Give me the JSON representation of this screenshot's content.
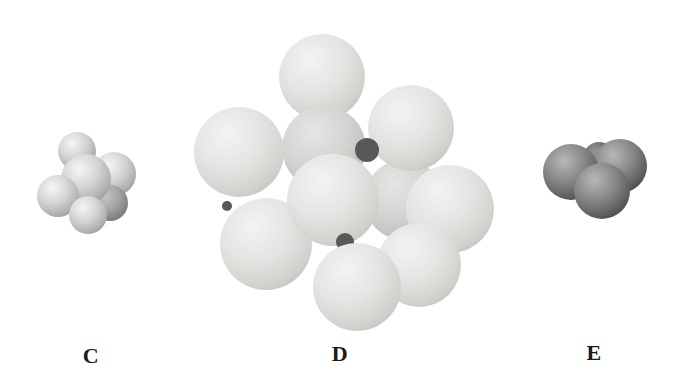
{
  "figure": {
    "type": "molecular-model-illustration",
    "background": "#ffffff",
    "width": 679,
    "height": 371,
    "label_color": "#1a1a1a",
    "clusters": [
      {
        "label": "C",
        "name": "small-light-gray-sphere-cluster",
        "label_x": 91,
        "label_y": 356,
        "palette": {
          "gradients": {
            "main": {
              "highlight": "#f6f6f6",
              "mid": "#d3d3d3",
              "low": "#aeaeae",
              "edge": "#898989"
            },
            "shaded": {
              "highlight": "#c6c6c6",
              "mid": "#a4a4a4",
              "low": "#828282",
              "edge": "#686868"
            }
          },
          "gap": "#6e6e6e"
        },
        "spheres": [
          {
            "name": "top",
            "cx": 77,
            "cy": 151,
            "r": 19
          },
          {
            "name": "right",
            "cx": 114,
            "cy": 174,
            "r": 22
          },
          {
            "name": "back-lower-right",
            "cx": 110,
            "cy": 203,
            "r": 18,
            "variant": "shaded"
          },
          {
            "name": "center",
            "cx": 86,
            "cy": 179,
            "r": 25
          },
          {
            "name": "left",
            "cx": 58,
            "cy": 196,
            "r": 21
          },
          {
            "name": "front-bottom",
            "cx": 88,
            "cy": 215,
            "r": 19
          }
        ]
      },
      {
        "label": "D",
        "name": "large-pale-sphere-cluster",
        "label_x": 340,
        "label_y": 354,
        "palette": {
          "gradients": {
            "main": {
              "highlight": "#f4f3f1",
              "mid": "#e5e4e2",
              "low": "#d2d1ce",
              "edge": "#b9b8b5"
            },
            "shaded": {
              "highlight": "#e6e5e3",
              "mid": "#d6d5d3",
              "low": "#c3c2bf",
              "edge": "#adacaa"
            }
          },
          "gap": "#585858"
        },
        "spheres": [
          {
            "name": "top",
            "cx": 322,
            "cy": 77,
            "r": 43
          },
          {
            "name": "upper-middle-back",
            "cx": 324,
            "cy": 148,
            "r": 42,
            "variant": "shaded"
          },
          {
            "name": "middle-right-back",
            "cx": 404,
            "cy": 200,
            "r": 40,
            "variant": "shaded"
          },
          {
            "name": "upper-right",
            "cx": 411,
            "cy": 128,
            "r": 43
          },
          {
            "name": "left",
            "cx": 239,
            "cy": 152,
            "r": 45
          },
          {
            "name": "crevice-1",
            "cx": 367,
            "cy": 150,
            "r": 12,
            "variant": "gap"
          },
          {
            "name": "far-right",
            "cx": 450,
            "cy": 209,
            "r": 44
          },
          {
            "name": "crevice-3",
            "cx": 227,
            "cy": 206,
            "r": 5,
            "variant": "gap"
          },
          {
            "name": "lower-left",
            "cx": 266,
            "cy": 244,
            "r": 46
          },
          {
            "name": "center",
            "cx": 333,
            "cy": 200,
            "r": 46
          },
          {
            "name": "crevice-2",
            "cx": 345,
            "cy": 242,
            "r": 9,
            "variant": "gap"
          },
          {
            "name": "lower-right",
            "cx": 419,
            "cy": 265,
            "r": 42
          },
          {
            "name": "front-bottom",
            "cx": 357,
            "cy": 287,
            "r": 44
          }
        ]
      },
      {
        "label": "E",
        "name": "small-dark-gray-sphere-cluster",
        "label_x": 594,
        "label_y": 353,
        "palette": {
          "gradients": {
            "main": {
              "highlight": "#b8b8b8",
              "mid": "#868686",
              "low": "#5c5c5c",
              "edge": "#3d3d3d"
            },
            "shaded": {
              "highlight": "#969696",
              "mid": "#6e6e6e",
              "low": "#4c4c4c",
              "edge": "#383838"
            }
          },
          "gap": "#2e2e2e"
        },
        "spheres": [
          {
            "name": "back-top",
            "cx": 599,
            "cy": 158,
            "r": 16,
            "variant": "shaded"
          },
          {
            "name": "right",
            "cx": 620,
            "cy": 166,
            "r": 27
          },
          {
            "name": "left",
            "cx": 571,
            "cy": 172,
            "r": 28
          },
          {
            "name": "front-bottom",
            "cx": 602,
            "cy": 191,
            "r": 28
          }
        ]
      }
    ]
  }
}
